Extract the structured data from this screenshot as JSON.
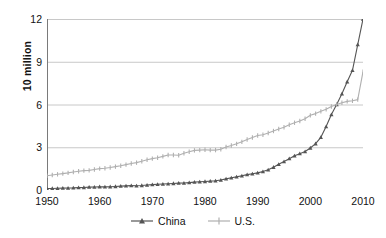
{
  "chart_data": {
    "type": "line",
    "title": "",
    "subtitle": "",
    "xlabel": "",
    "ylabel": "10 million",
    "xlim": [
      1950,
      2010
    ],
    "ylim": [
      0,
      12
    ],
    "xticks": [
      1950,
      1960,
      1970,
      1980,
      1990,
      2000,
      2010
    ],
    "yticks": [
      0,
      3,
      6,
      9,
      12
    ],
    "grid": "horizontal",
    "legend_position": "bottom",
    "x": [
      1950,
      1951,
      1952,
      1953,
      1954,
      1955,
      1956,
      1957,
      1958,
      1959,
      1960,
      1961,
      1962,
      1963,
      1964,
      1965,
      1966,
      1967,
      1968,
      1969,
      1970,
      1971,
      1972,
      1973,
      1974,
      1975,
      1976,
      1977,
      1978,
      1979,
      1980,
      1981,
      1982,
      1983,
      1984,
      1985,
      1986,
      1987,
      1988,
      1989,
      1990,
      1991,
      1992,
      1993,
      1994,
      1995,
      1996,
      1997,
      1998,
      1999,
      2000,
      2001,
      2002,
      2003,
      2004,
      2005,
      2006,
      2007,
      2008,
      2009,
      2010
    ],
    "series": [
      {
        "name": "China",
        "color": "#555555",
        "marker": "triangle",
        "values": [
          0.1,
          0.11,
          0.12,
          0.13,
          0.14,
          0.15,
          0.17,
          0.18,
          0.2,
          0.21,
          0.23,
          0.22,
          0.23,
          0.25,
          0.27,
          0.29,
          0.31,
          0.3,
          0.32,
          0.35,
          0.38,
          0.4,
          0.42,
          0.44,
          0.46,
          0.48,
          0.49,
          0.52,
          0.55,
          0.58,
          0.6,
          0.62,
          0.65,
          0.7,
          0.78,
          0.86,
          0.92,
          1.0,
          1.08,
          1.14,
          1.2,
          1.3,
          1.42,
          1.6,
          1.8,
          2.0,
          2.2,
          2.4,
          2.55,
          2.7,
          2.95,
          3.25,
          3.7,
          4.45,
          5.3,
          6.0,
          6.75,
          7.6,
          8.4,
          10.2,
          12.0
        ]
      },
      {
        "name": "U.S.",
        "color": "#b0b0b0",
        "marker": "plus",
        "values": [
          1.0,
          1.05,
          1.1,
          1.15,
          1.2,
          1.26,
          1.32,
          1.36,
          1.38,
          1.44,
          1.5,
          1.53,
          1.58,
          1.64,
          1.7,
          1.78,
          1.86,
          1.92,
          2.02,
          2.12,
          2.2,
          2.26,
          2.36,
          2.46,
          2.46,
          2.44,
          2.58,
          2.68,
          2.78,
          2.8,
          2.82,
          2.8,
          2.8,
          2.86,
          3.02,
          3.12,
          3.24,
          3.38,
          3.54,
          3.68,
          3.82,
          3.88,
          4.0,
          4.14,
          4.28,
          4.4,
          4.58,
          4.72,
          4.84,
          5.0,
          5.24,
          5.36,
          5.52,
          5.66,
          5.86,
          6.0,
          6.12,
          6.22,
          6.26,
          6.34,
          8.3
        ]
      }
    ]
  },
  "legend": {
    "items": [
      {
        "label": "China",
        "color": "#555555"
      },
      {
        "label": "U.S.",
        "color": "#b0b0b0"
      }
    ]
  },
  "axes": {
    "y_title": "10 million",
    "y_tick_labels": [
      "12",
      "9",
      "6",
      "3",
      "0"
    ],
    "x_tick_labels": [
      "1950",
      "1960",
      "1970",
      "1980",
      "1990",
      "2000",
      "2010"
    ]
  },
  "colors": {
    "grid": "#c8c8c8",
    "axis": "#7a7a7a",
    "background": "#ffffff",
    "china": "#555555",
    "us": "#b0b0b0"
  }
}
